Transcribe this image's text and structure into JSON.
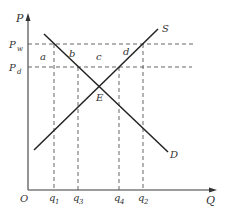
{
  "diagram": {
    "type": "supply-demand",
    "axes": {
      "y_label": "P",
      "x_label": "Q",
      "origin_label": "O"
    },
    "price_levels": [
      {
        "label": "P",
        "sub": "w",
        "name": "world-price"
      },
      {
        "label": "P",
        "sub": "d",
        "name": "domestic-price"
      }
    ],
    "quantity_levels": [
      {
        "label": "q",
        "sub": "1"
      },
      {
        "label": "q",
        "sub": "3"
      },
      {
        "label": "q",
        "sub": "4"
      },
      {
        "label": "q",
        "sub": "2"
      }
    ],
    "curves": {
      "supply": "S",
      "demand": "D"
    },
    "equilibrium_label": "E",
    "regions": [
      "a",
      "b",
      "c",
      "d"
    ],
    "colors": {
      "line": "#222222",
      "axis": "#777777",
      "dash": "#555555",
      "text": "#333333"
    }
  }
}
